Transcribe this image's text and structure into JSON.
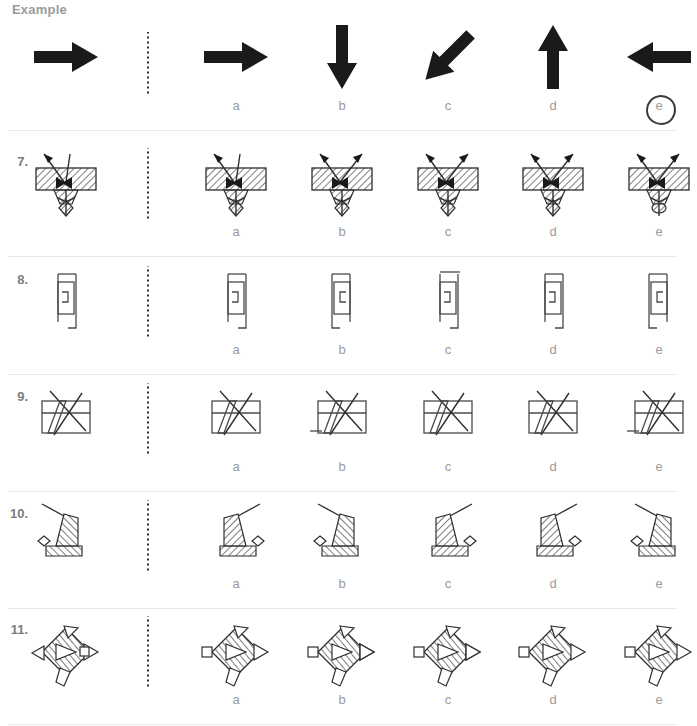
{
  "page": {
    "title": "Example",
    "kind": "spatial-reasoning-multiple-choice",
    "option_letters": [
      "a",
      "b",
      "c",
      "d",
      "e"
    ],
    "divider_style": "vertical-dotted",
    "marked_answer_row": "example",
    "marked_answer_letter": "e",
    "colors": {
      "label_gray": "#9b9b9b",
      "rownum_gray": "#7d7d7d",
      "separator": "#e8e9ea",
      "figure_line": "#4a4a4a",
      "figure_solid": "#1a1a1a",
      "mark": "#3a3a3a",
      "background": "#ffffff"
    }
  },
  "rows": [
    {
      "id": "example",
      "number": "",
      "heading": "Example",
      "prompt": {
        "name": "arrow-right",
        "kind": "solid-arrow",
        "rotation": 0
      },
      "options": [
        {
          "letter": "a",
          "name": "arrow-right",
          "kind": "solid-arrow",
          "rotation": 0
        },
        {
          "letter": "b",
          "name": "arrow-down",
          "kind": "solid-arrow",
          "rotation": 90
        },
        {
          "letter": "c",
          "name": "arrow-down-left",
          "kind": "solid-arrow",
          "rotation": 135
        },
        {
          "letter": "d",
          "name": "arrow-up",
          "kind": "solid-arrow",
          "rotation": -90
        },
        {
          "letter": "e",
          "name": "arrow-left",
          "kind": "solid-arrow",
          "rotation": 180
        }
      ]
    },
    {
      "id": "q7",
      "number": "7.",
      "prompt": {
        "name": "hatched-block-with-arrows",
        "kind": "fig7",
        "variant": 0
      },
      "options": [
        {
          "letter": "a",
          "name": "hatched-block-with-arrows",
          "kind": "fig7",
          "variant": 1
        },
        {
          "letter": "b",
          "name": "hatched-block-with-arrows",
          "kind": "fig7",
          "variant": 2
        },
        {
          "letter": "c",
          "name": "hatched-block-with-arrows",
          "kind": "fig7",
          "variant": 3
        },
        {
          "letter": "d",
          "name": "hatched-block-with-arrows",
          "kind": "fig7",
          "variant": 4
        },
        {
          "letter": "e",
          "name": "hatched-block-with-arrows",
          "kind": "fig7",
          "variant": 5
        }
      ]
    },
    {
      "id": "q8",
      "number": "8.",
      "prompt": {
        "name": "stepped-bracket-outline",
        "kind": "fig8",
        "variant": 0
      },
      "options": [
        {
          "letter": "a",
          "name": "stepped-bracket-outline",
          "kind": "fig8",
          "variant": 1
        },
        {
          "letter": "b",
          "name": "stepped-bracket-outline",
          "kind": "fig8",
          "variant": 2
        },
        {
          "letter": "c",
          "name": "stepped-bracket-outline",
          "kind": "fig8",
          "variant": 3
        },
        {
          "letter": "d",
          "name": "stepped-bracket-outline",
          "kind": "fig8",
          "variant": 4
        },
        {
          "letter": "e",
          "name": "stepped-bracket-outline",
          "kind": "fig8",
          "variant": 5
        }
      ]
    },
    {
      "id": "q9",
      "number": "9.",
      "prompt": {
        "name": "crossed-rectangle",
        "kind": "fig9",
        "variant": 0
      },
      "options": [
        {
          "letter": "a",
          "name": "crossed-rectangle",
          "kind": "fig9",
          "variant": 1
        },
        {
          "letter": "b",
          "name": "crossed-rectangle",
          "kind": "fig9",
          "variant": 2
        },
        {
          "letter": "c",
          "name": "crossed-rectangle",
          "kind": "fig9",
          "variant": 3
        },
        {
          "letter": "d",
          "name": "crossed-rectangle",
          "kind": "fig9",
          "variant": 4
        },
        {
          "letter": "e",
          "name": "crossed-rectangle",
          "kind": "fig9",
          "variant": 5
        }
      ]
    },
    {
      "id": "q10",
      "number": "10.",
      "prompt": {
        "name": "striped-wedge-with-antenna",
        "kind": "fig10",
        "variant": 0
      },
      "options": [
        {
          "letter": "a",
          "name": "striped-wedge-with-antenna",
          "kind": "fig10",
          "variant": 1
        },
        {
          "letter": "b",
          "name": "striped-wedge-with-antenna",
          "kind": "fig10",
          "variant": 2
        },
        {
          "letter": "c",
          "name": "striped-wedge-with-antenna",
          "kind": "fig10",
          "variant": 3
        },
        {
          "letter": "d",
          "name": "striped-wedge-with-antenna",
          "kind": "fig10",
          "variant": 4
        },
        {
          "letter": "e",
          "name": "striped-wedge-with-antenna",
          "kind": "fig10",
          "variant": 5
        }
      ]
    },
    {
      "id": "q11",
      "number": "11.",
      "prompt": {
        "name": "hatched-diamond-with-fins",
        "kind": "fig11",
        "variant": 0
      },
      "options": [
        {
          "letter": "a",
          "name": "hatched-diamond-with-fins",
          "kind": "fig11",
          "variant": 1
        },
        {
          "letter": "b",
          "name": "hatched-diamond-with-fins",
          "kind": "fig11",
          "variant": 2
        },
        {
          "letter": "c",
          "name": "hatched-diamond-with-fins",
          "kind": "fig11",
          "variant": 3
        },
        {
          "letter": "d",
          "name": "hatched-diamond-with-fins",
          "kind": "fig11",
          "variant": 4
        },
        {
          "letter": "e",
          "name": "hatched-diamond-with-fins",
          "kind": "fig11",
          "variant": 5
        }
      ]
    }
  ],
  "layout": {
    "prompt_x": 20,
    "divider_x": 147,
    "option_x": [
      190,
      296,
      402,
      507,
      613
    ],
    "row_tops": [
      14,
      140,
      258,
      375,
      492,
      608
    ],
    "row_height": 118
  }
}
